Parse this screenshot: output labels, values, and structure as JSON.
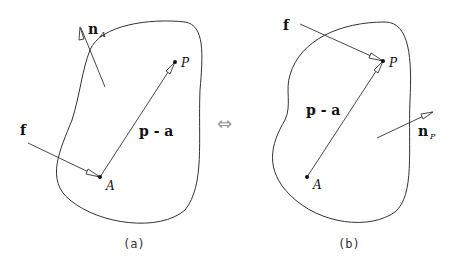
{
  "panels": [
    {
      "id": "a",
      "caption": "(a)",
      "point_P_label": "P",
      "point_A_label": "A",
      "force_label": "f",
      "vector_label": "p - a",
      "normal_label": "n",
      "normal_subscript": "A"
    },
    {
      "id": "b",
      "caption": "(b)",
      "point_P_label": "P",
      "point_A_label": "A",
      "force_label": "f",
      "vector_label": "p - a",
      "normal_label": "n",
      "normal_subscript": "P"
    }
  ],
  "equivalence_symbol": "⇔"
}
